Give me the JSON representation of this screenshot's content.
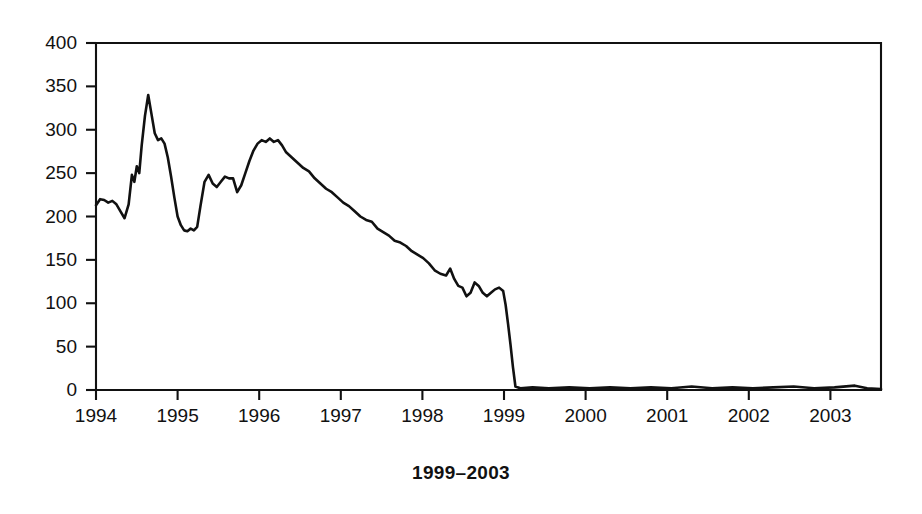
{
  "caption": "1999–2003",
  "chart_data": {
    "type": "line",
    "title": "",
    "subtitle": "",
    "xlabel": "",
    "ylabel": "",
    "grid": false,
    "legend": null,
    "legend_position": "none",
    "xlim": [
      1994.0,
      2003.62
    ],
    "ylim": [
      0,
      400
    ],
    "xticks": [
      1994,
      1995,
      1996,
      1997,
      1998,
      1999,
      2000,
      2001,
      2002,
      2003
    ],
    "xtick_labels": [
      "1994",
      "1995",
      "1996",
      "1997",
      "1998",
      "1999",
      "2000",
      "2001",
      "2002",
      "2003"
    ],
    "yticks": [
      0,
      50,
      100,
      150,
      200,
      250,
      300,
      350,
      400
    ],
    "ytick_labels": [
      "0",
      "50",
      "100",
      "150",
      "200",
      "250",
      "300",
      "350",
      "400"
    ],
    "line_color": "#111111",
    "series": [
      {
        "name": "series-1",
        "x": [
          1994.0,
          1994.05,
          1994.1,
          1994.15,
          1994.2,
          1994.25,
          1994.3,
          1994.35,
          1994.4,
          1994.44,
          1994.47,
          1994.5,
          1994.53,
          1994.56,
          1994.6,
          1994.64,
          1994.68,
          1994.72,
          1994.76,
          1994.8,
          1994.84,
          1994.88,
          1994.92,
          1994.96,
          1995.0,
          1995.04,
          1995.08,
          1995.12,
          1995.16,
          1995.2,
          1995.24,
          1995.28,
          1995.33,
          1995.38,
          1995.43,
          1995.48,
          1995.53,
          1995.58,
          1995.63,
          1995.68,
          1995.73,
          1995.78,
          1995.83,
          1995.88,
          1995.93,
          1995.98,
          1996.03,
          1996.08,
          1996.13,
          1996.18,
          1996.23,
          1996.28,
          1996.33,
          1996.4,
          1996.47,
          1996.54,
          1996.61,
          1996.68,
          1996.75,
          1996.82,
          1996.89,
          1996.96,
          1997.03,
          1997.1,
          1997.17,
          1997.24,
          1997.31,
          1997.38,
          1997.45,
          1997.52,
          1997.59,
          1997.66,
          1997.73,
          1997.8,
          1997.87,
          1997.94,
          1998.01,
          1998.08,
          1998.15,
          1998.22,
          1998.29,
          1998.34,
          1998.39,
          1998.44,
          1998.49,
          1998.54,
          1998.59,
          1998.64,
          1998.69,
          1998.74,
          1998.79,
          1998.84,
          1998.89,
          1998.94,
          1998.99,
          1999.02,
          1999.05,
          1999.08,
          1999.11,
          1999.14,
          1999.2,
          1999.35,
          1999.55,
          1999.8,
          2000.05,
          2000.3,
          2000.55,
          2000.8,
          2001.05,
          2001.3,
          2001.55,
          2001.8,
          2002.05,
          2002.3,
          2002.55,
          2002.8,
          2003.05,
          2003.3,
          2003.45,
          2003.62
        ],
        "values": [
          213,
          220,
          219,
          216,
          218,
          214,
          206,
          198,
          214,
          248,
          240,
          258,
          250,
          282,
          316,
          340,
          318,
          296,
          288,
          290,
          284,
          268,
          246,
          222,
          200,
          190,
          184,
          183,
          186,
          184,
          188,
          212,
          240,
          248,
          238,
          234,
          240,
          246,
          244,
          244,
          228,
          236,
          250,
          264,
          276,
          284,
          288,
          286,
          290,
          286,
          288,
          282,
          274,
          268,
          262,
          256,
          252,
          244,
          238,
          232,
          228,
          222,
          216,
          212,
          206,
          200,
          196,
          194,
          186,
          182,
          178,
          172,
          170,
          166,
          160,
          156,
          152,
          146,
          138,
          134,
          132,
          140,
          128,
          120,
          118,
          108,
          112,
          124,
          120,
          112,
          108,
          112,
          116,
          118,
          114,
          98,
          76,
          52,
          26,
          4,
          2,
          3,
          2,
          3,
          2,
          3,
          2,
          3,
          2,
          4,
          2,
          3,
          2,
          3,
          4,
          2,
          3,
          5,
          2,
          1
        ]
      }
    ]
  }
}
